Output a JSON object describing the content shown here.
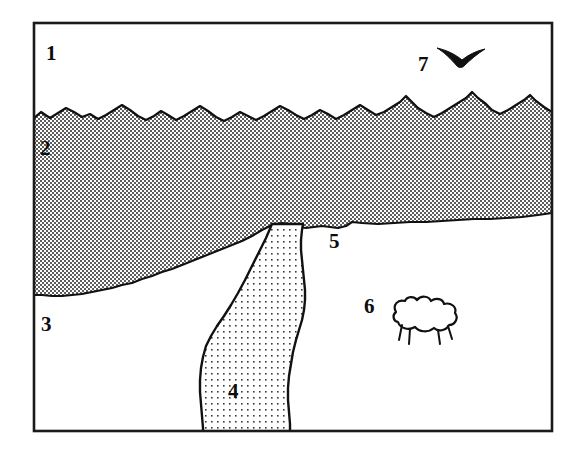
{
  "figure": {
    "frame": {
      "border_color": "#1a1a1a",
      "background_color": "#ffffff"
    },
    "regions": [
      {
        "id": "sky",
        "number": "1",
        "fill_name": "white",
        "fill_color": "#ffffff",
        "label_x": 46,
        "label_y": 60
      },
      {
        "id": "hillside-crosshatch",
        "number": "2",
        "fill_name": "cross-hatch",
        "fill_color": "#9a9a9a",
        "label_x": 40,
        "label_y": 155
      },
      {
        "id": "field-left",
        "number": "3",
        "fill_name": "white",
        "fill_color": "#ffffff",
        "label_x": 41,
        "label_y": 331
      },
      {
        "id": "river-stippled",
        "number": "4",
        "fill_name": "stipple-dots",
        "fill_color": "#e0e0e0",
        "label_x": 228,
        "label_y": 398
      },
      {
        "id": "field-right",
        "number": "5",
        "fill_name": "white",
        "fill_color": "#ffffff",
        "label_x": 329,
        "label_y": 248
      },
      {
        "id": "sheep",
        "number": "6",
        "fill_name": "white-outline",
        "fill_color": "#ffffff",
        "label_x": 364,
        "label_y": 313
      },
      {
        "id": "bird",
        "number": "7",
        "fill_name": "solid-black",
        "fill_color": "#111111",
        "label_x": 418,
        "label_y": 71
      }
    ],
    "icons": {
      "bird": "bird-silhouette-icon",
      "sheep": "sheep-icon"
    }
  }
}
